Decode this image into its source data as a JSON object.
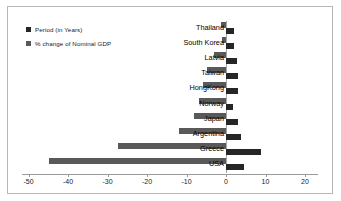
{
  "chart_data": {
    "type": "bar",
    "orientation": "horizontal",
    "title": "",
    "subtitle": "",
    "xlabel": "",
    "ylabel": "",
    "xlim": [
      -50,
      20
    ],
    "xticks": [
      -50,
      -40,
      -30,
      -20,
      -10,
      0,
      10,
      20
    ],
    "xtick_labels": [
      "-50",
      "-40",
      "-30",
      "-20",
      "-10",
      "0",
      "10",
      "20"
    ],
    "grid": false,
    "legend_position": "top-left",
    "categories": [
      "Thailand",
      "South Korea",
      "Latvia",
      "Taiwan",
      "HongKong",
      "Norway",
      "Japan",
      "Argentina",
      "Greece",
      "USA"
    ],
    "series": [
      {
        "name": "Period (in Years)",
        "color": "#262626",
        "values": [
          1.9,
          1.9,
          2.8,
          3.0,
          3.0,
          1.8,
          3.0,
          3.9,
          8.8,
          4.6
        ]
      },
      {
        "name": "% change of Nominal GDP",
        "color": "#595959",
        "values": [
          -1.3,
          -1.1,
          -3.0,
          -4.8,
          -5.9,
          -6.8,
          -8.0,
          -11.9,
          -27.4,
          -44.7
        ]
      }
    ]
  },
  "legend": {
    "items": [
      {
        "label": "Period (in Years)",
        "color": "#262626"
      },
      {
        "label": "% change of Nominal GDP",
        "color": "#595959"
      }
    ]
  },
  "axis": {
    "tick_labels": [
      "-50",
      "-40",
      "-30",
      "-20",
      "-10",
      "0",
      "10",
      "20"
    ]
  },
  "colors": {
    "series_dark": "#262626",
    "series_gray": "#595959",
    "frame_border": "#b7b7b7",
    "axis_line": "#9a9a9a",
    "background": "#ffffff"
  }
}
